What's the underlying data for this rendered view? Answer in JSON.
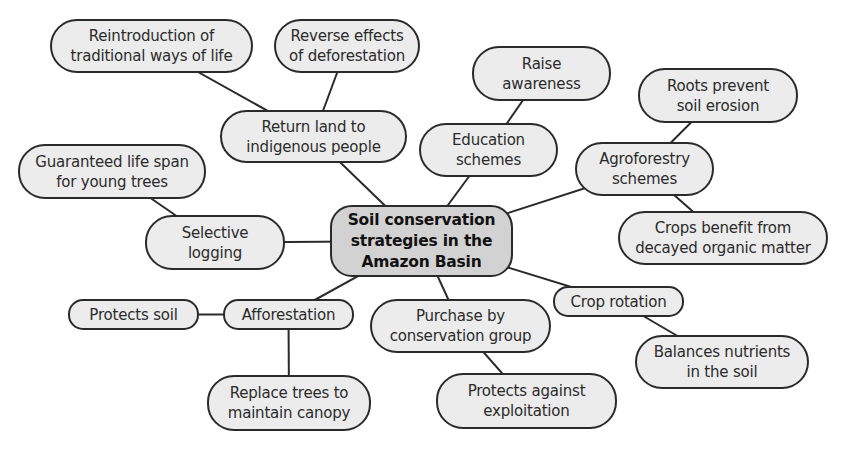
{
  "diagram": {
    "type": "mind-map",
    "central": {
      "id": "central",
      "label": "Soil conservation\nstrategies in the\nAmazon Basin"
    },
    "nodes": [
      {
        "id": "return-land",
        "label": "Return land to\nindigenous people"
      },
      {
        "id": "reintroduction",
        "label": "Reintroduction of\ntraditional ways of life"
      },
      {
        "id": "reverse-effects",
        "label": "Reverse effects\nof deforestation"
      },
      {
        "id": "education",
        "label": "Education\nschemes"
      },
      {
        "id": "raise-awareness",
        "label": "Raise\nawareness"
      },
      {
        "id": "agroforestry",
        "label": "Agroforestry\nschemes"
      },
      {
        "id": "roots-prevent",
        "label": "Roots prevent\nsoil erosion"
      },
      {
        "id": "crops-benefit",
        "label": "Crops benefit from\ndecayed organic matter"
      },
      {
        "id": "selective-logging",
        "label": "Selective\nlogging"
      },
      {
        "id": "guaranteed-life",
        "label": "Guaranteed life span\nfor young trees"
      },
      {
        "id": "afforestation",
        "label": "Afforestation"
      },
      {
        "id": "protects-soil",
        "label": "Protects soil"
      },
      {
        "id": "replace-trees",
        "label": "Replace trees to\nmaintain canopy"
      },
      {
        "id": "purchase",
        "label": "Purchase by\nconservation group"
      },
      {
        "id": "protects-against",
        "label": "Protects against\nexploitation"
      },
      {
        "id": "crop-rotation",
        "label": "Crop rotation"
      },
      {
        "id": "balances-nutrients",
        "label": "Balances nutrients\nin the soil"
      }
    ],
    "edges": [
      [
        "central",
        "return-land"
      ],
      [
        "return-land",
        "reintroduction"
      ],
      [
        "return-land",
        "reverse-effects"
      ],
      [
        "central",
        "education"
      ],
      [
        "education",
        "raise-awareness"
      ],
      [
        "central",
        "agroforestry"
      ],
      [
        "agroforestry",
        "roots-prevent"
      ],
      [
        "agroforestry",
        "crops-benefit"
      ],
      [
        "central",
        "selective-logging"
      ],
      [
        "selective-logging",
        "guaranteed-life"
      ],
      [
        "central",
        "afforestation"
      ],
      [
        "afforestation",
        "protects-soil"
      ],
      [
        "afforestation",
        "replace-trees"
      ],
      [
        "central",
        "purchase"
      ],
      [
        "purchase",
        "protects-against"
      ],
      [
        "central",
        "crop-rotation"
      ],
      [
        "crop-rotation",
        "balances-nutrients"
      ]
    ]
  }
}
